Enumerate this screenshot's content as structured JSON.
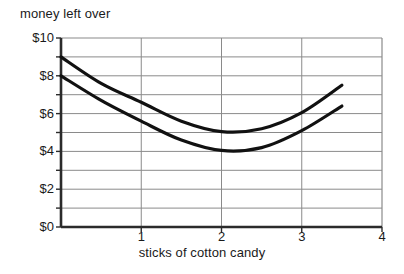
{
  "chart_data": {
    "type": "line",
    "title": "",
    "xlabel": "sticks of cotton candy",
    "ylabel": "money left over",
    "xlim": [
      0,
      4
    ],
    "ylim": [
      0,
      10
    ],
    "grid": true,
    "legend": "none",
    "x_ticks": [
      "1",
      "2",
      "3",
      "4"
    ],
    "x_tick_values": [
      1,
      2,
      3,
      4
    ],
    "y_ticks": [
      "$0",
      "$2",
      "$4",
      "$6",
      "$8",
      "$10"
    ],
    "y_tick_values": [
      0,
      2,
      4,
      6,
      8,
      10
    ],
    "y_gridline_values": [
      0,
      1,
      2,
      3,
      4,
      5,
      6,
      7,
      8,
      9,
      10
    ],
    "series": [
      {
        "name": "upper curve",
        "color": "#111111",
        "x": [
          0,
          0.5,
          1,
          1.5,
          2,
          2.5,
          3,
          3.5
        ],
        "values": [
          9,
          7.6,
          6.6,
          5.6,
          5.05,
          5.2,
          6.05,
          7.5
        ]
      },
      {
        "name": "lower curve",
        "color": "#111111",
        "x": [
          0,
          0.5,
          1,
          1.5,
          2,
          2.5,
          3,
          3.5
        ],
        "values": [
          8,
          6.7,
          5.6,
          4.6,
          4.05,
          4.2,
          5.1,
          6.4
        ]
      }
    ]
  },
  "axis": {
    "frame_color": "#2b2b2b",
    "grid_color": "#8a8a8a"
  }
}
